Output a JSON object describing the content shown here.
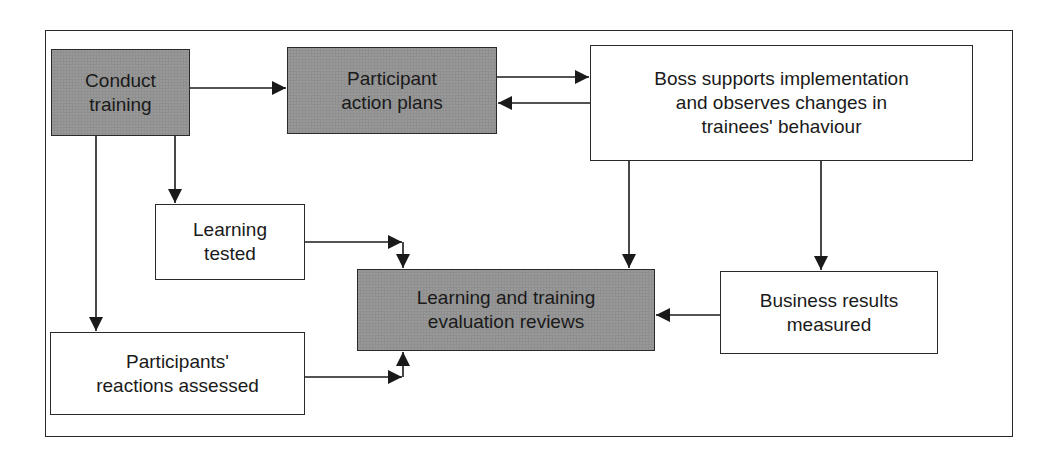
{
  "diagram": {
    "nodes": [
      {
        "id": "conduct-training",
        "label": "Conduct\ntraining",
        "shaded": true
      },
      {
        "id": "participant-action-plans",
        "label": "Participant\naction plans",
        "shaded": true
      },
      {
        "id": "boss-supports",
        "label": "Boss supports implementation\nand observes changes in\ntrainees' behaviour",
        "shaded": false
      },
      {
        "id": "learning-tested",
        "label": "Learning\ntested",
        "shaded": false
      },
      {
        "id": "evaluation-reviews",
        "label": "Learning and training\nevaluation reviews",
        "shaded": true
      },
      {
        "id": "business-results",
        "label": "Business results\nmeasured",
        "shaded": false
      },
      {
        "id": "reactions-assessed",
        "label": "Participants'\nreactions assessed",
        "shaded": false
      }
    ],
    "edges": [
      {
        "from": "conduct-training",
        "to": "participant-action-plans"
      },
      {
        "from": "participant-action-plans",
        "to": "boss-supports"
      },
      {
        "from": "boss-supports",
        "to": "participant-action-plans"
      },
      {
        "from": "conduct-training",
        "to": "learning-tested"
      },
      {
        "from": "conduct-training",
        "to": "reactions-assessed"
      },
      {
        "from": "boss-supports",
        "to": "evaluation-reviews"
      },
      {
        "from": "boss-supports",
        "to": "business-results"
      },
      {
        "from": "learning-tested",
        "to": "evaluation-reviews"
      },
      {
        "from": "reactions-assessed",
        "to": "evaluation-reviews"
      },
      {
        "from": "business-results",
        "to": "evaluation-reviews"
      }
    ],
    "colors": {
      "shaded_fill": "#8f8f8f",
      "plain_fill": "#ffffff",
      "stroke": "#2a2a2a"
    }
  }
}
